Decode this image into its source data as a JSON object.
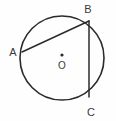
{
  "figure": {
    "background_color": "#fefefe",
    "stroke_color": "#2b2b2b",
    "label_color": "#3a3a3a",
    "width": 116,
    "height": 121
  },
  "circle": {
    "name": "circle-outline",
    "center_x": 62,
    "center_y": 58,
    "radius": 42
  },
  "center_marker": {
    "name": "center-point-dot",
    "x": 62,
    "y": 55,
    "radius": 1.6,
    "label": "O",
    "label_x": 62,
    "label_y": 69
  },
  "points": [
    {
      "id": "A",
      "label": "A",
      "x": 22,
      "y": 52,
      "label_x": 13,
      "label_y": 56
    },
    {
      "id": "B",
      "label": "B",
      "x": 89,
      "y": 21,
      "label_x": 88,
      "label_y": 13
    },
    {
      "id": "C",
      "label": "C",
      "x": 89,
      "y": 97,
      "label_x": 91,
      "label_y": 116
    }
  ],
  "chords": [
    {
      "id": "AB",
      "name": "chord-ab",
      "x1": 22,
      "y1": 52,
      "x2": 89,
      "y2": 21
    },
    {
      "id": "BC",
      "name": "chord-bc",
      "x1": 89,
      "y1": 21,
      "x2": 89,
      "y2": 97
    }
  ]
}
